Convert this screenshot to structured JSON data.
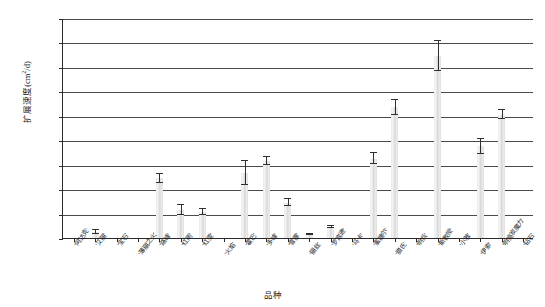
{
  "chart_data": {
    "type": "bar",
    "title": "",
    "xlabel": "品种",
    "ylabel": "扩展速度(cm2/d)",
    "ylabel_base": "扩展速度(cm",
    "ylabel_sup": "2",
    "ylabel_tail": "/d)",
    "ylim": [
      0,
      0.9
    ],
    "grid": true,
    "legend": "none",
    "ytick_labels": [
      "0",
      "0.10",
      "0.20",
      "0.30",
      "0.40",
      "0.50",
      "0.60",
      "0.70",
      "0.80",
      "0.90"
    ],
    "ytick_values": [
      0,
      0.1,
      0.2,
      0.3,
      0.4,
      0.5,
      0.6,
      0.7,
      0.8,
      0.9
    ],
    "categories": [
      "'阿达克'",
      "'艾丽'",
      "'宝石'",
      "'薄丽之火'",
      "'路峰'",
      "'红雨'",
      "'红雯'",
      "'火焰'",
      "'霍巴'",
      "'多峰'",
      "'雪霎'",
      "'丽丝'",
      "'罗宾逊'",
      "'马卡'",
      "'蜜糖尔'",
      "'腊氏'",
      "'明兵'",
      "'斯教授'",
      "'小雅'",
      "'伊索'",
      "'明亮炭魔力'",
      "'钻石'"
    ],
    "values": [
      0.0,
      0.025,
      0.0,
      0.0,
      0.245,
      0.115,
      0.105,
      0.0,
      0.265,
      0.315,
      0.145,
      0.015,
      0.045,
      0.0,
      0.325,
      0.535,
      0.0,
      0.745,
      0.0,
      0.375,
      0.505,
      0.0
    ],
    "errors": [
      0.0,
      0.008,
      0.0,
      0.0,
      0.018,
      0.02,
      0.012,
      0.0,
      0.05,
      0.015,
      0.015,
      0.003,
      0.004,
      0.0,
      0.022,
      0.03,
      0.0,
      0.06,
      0.0,
      0.03,
      0.018,
      0.0
    ]
  }
}
